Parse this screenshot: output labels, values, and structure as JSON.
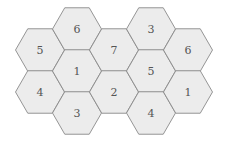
{
  "diagram": {
    "title": "",
    "hex_radius": 24.5,
    "colors": {
      "background": "#ffffff",
      "fill": "#ececec",
      "stroke": "#8a8a8a",
      "text": "#555555"
    },
    "tiles": [
      {
        "label": "5",
        "cx": 40,
        "cy": 50
      },
      {
        "label": "4",
        "cx": 40,
        "cy": 92
      },
      {
        "label": "6",
        "cx": 77,
        "cy": 29
      },
      {
        "label": "1",
        "cx": 77,
        "cy": 71
      },
      {
        "label": "3",
        "cx": 77,
        "cy": 113
      },
      {
        "label": "7",
        "cx": 114,
        "cy": 50
      },
      {
        "label": "2",
        "cx": 114,
        "cy": 92
      },
      {
        "label": "3",
        "cx": 151,
        "cy": 29
      },
      {
        "label": "5",
        "cx": 151,
        "cy": 71
      },
      {
        "label": "4",
        "cx": 151,
        "cy": 113
      },
      {
        "label": "6",
        "cx": 188,
        "cy": 50
      },
      {
        "label": "1",
        "cx": 188,
        "cy": 92
      }
    ]
  }
}
